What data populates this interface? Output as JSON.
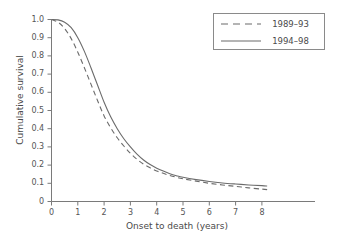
{
  "chart_data": {
    "type": "line",
    "title": "",
    "xlabel": "Onset to death (years)",
    "ylabel": "Cumulative survival",
    "xlim": [
      0,
      8.8
    ],
    "ylim": [
      0,
      1.0
    ],
    "grid": false,
    "legend_position": "top-right",
    "xticks": [
      "0",
      "1",
      "2",
      "3",
      "4",
      "5",
      "6",
      "7",
      "8"
    ],
    "xtick_values": [
      0,
      1,
      2,
      3,
      4,
      5,
      6,
      7,
      8
    ],
    "yticks": [
      "0",
      "0.1",
      "0.2",
      "0.3",
      "0.4",
      "0.5",
      "0.6",
      "0.7",
      "0.8",
      "0.9",
      "1.0"
    ],
    "ytick_values": [
      0,
      0.1,
      0.2,
      0.3,
      0.4,
      0.5,
      0.6,
      0.7,
      0.8,
      0.9,
      1.0
    ],
    "x": [
      0,
      0.25,
      0.5,
      0.75,
      1.0,
      1.25,
      1.5,
      1.75,
      2.0,
      2.25,
      2.5,
      2.75,
      3.0,
      3.25,
      3.5,
      3.75,
      4.0,
      4.25,
      4.5,
      4.75,
      5.0,
      5.5,
      6.0,
      6.5,
      7.0,
      7.5,
      8.0,
      8.2
    ],
    "series": [
      {
        "name": "1989–93",
        "style": "dashed",
        "color": "#6b6b6b",
        "values": [
          1.0,
          0.985,
          0.95,
          0.895,
          0.82,
          0.735,
          0.645,
          0.555,
          0.47,
          0.405,
          0.35,
          0.305,
          0.265,
          0.232,
          0.205,
          0.185,
          0.168,
          0.155,
          0.143,
          0.133,
          0.125,
          0.112,
          0.1,
          0.091,
          0.083,
          0.075,
          0.068,
          0.065
        ]
      },
      {
        "name": "1994–98",
        "style": "solid",
        "color": "#6b6b6b",
        "values": [
          1.0,
          0.998,
          0.985,
          0.955,
          0.9,
          0.825,
          0.735,
          0.64,
          0.545,
          0.465,
          0.4,
          0.345,
          0.3,
          0.26,
          0.228,
          0.203,
          0.183,
          0.167,
          0.153,
          0.142,
          0.133,
          0.12,
          0.11,
          0.102,
          0.096,
          0.091,
          0.087,
          0.085
        ]
      }
    ]
  },
  "legend": {
    "entries": [
      {
        "label": "1989–93",
        "style": "dashed"
      },
      {
        "label": "1994–98",
        "style": "solid"
      }
    ]
  },
  "axes": {
    "x_title": "Onset to death (years)",
    "y_title": "Cumulative survival",
    "x_labels": [
      "0",
      "1",
      "2",
      "3",
      "4",
      "5",
      "6",
      "7",
      "8"
    ],
    "y_labels": [
      "1.0",
      "0.9",
      "0.8",
      "0.7",
      "0.6",
      "0.5",
      "0.4",
      "0.3",
      "0.2",
      "0.1",
      "0"
    ]
  },
  "colors": {
    "axis": "#7a7a7a",
    "curve": "#6b6b6b",
    "text": "#4a4a4a",
    "background": "#ffffff",
    "legend_border": "#8a8a8a"
  }
}
